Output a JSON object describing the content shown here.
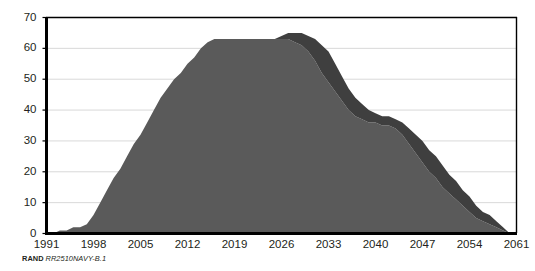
{
  "caption": {
    "brand": "RAND",
    "document_id": "RR2510NAVY-B.1"
  },
  "chart_data": {
    "type": "area",
    "title": "",
    "xlabel": "",
    "ylabel": "",
    "xlim": [
      1991,
      2061
    ],
    "ylim": [
      0,
      70
    ],
    "grid": true,
    "legend": false,
    "xticks": [
      1991,
      1998,
      2005,
      2012,
      2019,
      2026,
      2033,
      2040,
      2047,
      2054,
      2061
    ],
    "yticks": [
      0,
      10,
      20,
      30,
      40,
      50,
      60,
      70
    ],
    "colors": {
      "series_lower": "#5a5a5a",
      "series_upper": "#3f3f3f",
      "axis": "#000000",
      "grid": "#d9d9d9",
      "text": "#231f20"
    },
    "stacked": true,
    "x": [
      1991,
      1992,
      1993,
      1994,
      1995,
      1996,
      1997,
      1998,
      1999,
      2000,
      2001,
      2002,
      2003,
      2004,
      2005,
      2006,
      2007,
      2008,
      2009,
      2010,
      2011,
      2012,
      2013,
      2014,
      2015,
      2016,
      2017,
      2018,
      2019,
      2020,
      2021,
      2022,
      2023,
      2024,
      2025,
      2026,
      2027,
      2028,
      2029,
      2030,
      2031,
      2032,
      2033,
      2034,
      2035,
      2036,
      2037,
      2038,
      2039,
      2040,
      2041,
      2042,
      2043,
      2044,
      2045,
      2046,
      2047,
      2048,
      2049,
      2050,
      2051,
      2052,
      2053,
      2054,
      2055,
      2056,
      2057,
      2058,
      2059,
      2060,
      2061
    ],
    "series": [
      {
        "name": "lower-band",
        "values": [
          0,
          0,
          1,
          1,
          2,
          2,
          3,
          6,
          10,
          14,
          18,
          21,
          25,
          29,
          32,
          36,
          40,
          44,
          47,
          50,
          52,
          55,
          57,
          60,
          62,
          63,
          63,
          63,
          63,
          63,
          63,
          63,
          63,
          63,
          63,
          63,
          63,
          62,
          61,
          59,
          56,
          52,
          49,
          46,
          43,
          40,
          38,
          37,
          36,
          36,
          35,
          35,
          34,
          32,
          29,
          26,
          23,
          20,
          18,
          15,
          13,
          11,
          9,
          7,
          5,
          4,
          3,
          2,
          1,
          0,
          0
        ]
      },
      {
        "name": "upper-band",
        "values": [
          0,
          0,
          0,
          0,
          0,
          0,
          0,
          0,
          0,
          0,
          0,
          0,
          0,
          0,
          0,
          0,
          0,
          0,
          0,
          0,
          0,
          0,
          0,
          0,
          0,
          0,
          0,
          0,
          0,
          0,
          0,
          0,
          0,
          0,
          0,
          1,
          2,
          3,
          4,
          5,
          7,
          9,
          10,
          9,
          8,
          7,
          6,
          5,
          4,
          3,
          3,
          3,
          3,
          4,
          5,
          6,
          7,
          7,
          7,
          7,
          6,
          6,
          5,
          5,
          4,
          3,
          3,
          2,
          1,
          0,
          0
        ]
      }
    ],
    "totals": [
      0,
      0,
      1,
      1,
      2,
      2,
      3,
      6,
      10,
      14,
      18,
      21,
      25,
      29,
      32,
      36,
      40,
      44,
      47,
      50,
      52,
      55,
      57,
      60,
      62,
      63,
      63,
      63,
      63,
      63,
      63,
      63,
      63,
      63,
      63,
      64,
      65,
      65,
      65,
      64,
      63,
      61,
      59,
      55,
      51,
      47,
      44,
      42,
      40,
      39,
      38,
      38,
      37,
      36,
      34,
      32,
      30,
      27,
      25,
      22,
      19,
      17,
      14,
      12,
      9,
      7,
      6,
      4,
      2,
      0,
      0
    ]
  }
}
